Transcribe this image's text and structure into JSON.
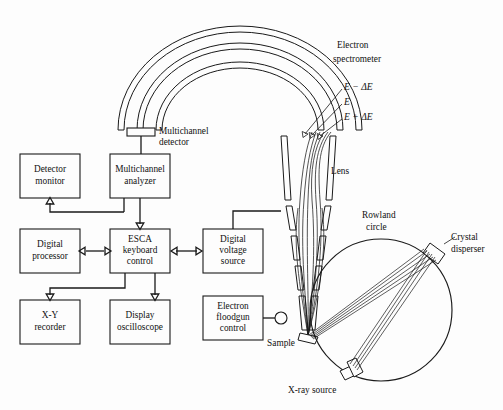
{
  "figure": {
    "background_color": "#fdfdfd",
    "line_color": "#1a1a1a"
  },
  "blocks": [
    {
      "id": "detector-monitor",
      "line1": "Detector",
      "line2": "monitor",
      "line3": ""
    },
    {
      "id": "multichannel-analyzer",
      "line1": "Multichannel",
      "line2": "analyzer",
      "line3": ""
    },
    {
      "id": "digital-processor",
      "line1": "Digital",
      "line2": "processor",
      "line3": ""
    },
    {
      "id": "esca-keyboard-control",
      "line1": "ESCA",
      "line2": "keyboard",
      "line3": "control"
    },
    {
      "id": "digital-voltage-source",
      "line1": "Digital",
      "line2": "voltage",
      "line3": "source"
    },
    {
      "id": "xy-recorder",
      "line1": "X-Y",
      "line2": "recorder",
      "line3": ""
    },
    {
      "id": "display-oscilloscope",
      "line1": "Display",
      "line2": "oscilloscope",
      "line3": ""
    },
    {
      "id": "electron-floodgun-control",
      "line1": "Electron",
      "line2": "floodgun",
      "line3": "control"
    }
  ],
  "callouts": {
    "multichannel_detector_l1": "Multichannel",
    "multichannel_detector_l2": "detector",
    "electron_spectrometer_l1": "Electron",
    "electron_spectrometer_l2": "spectrometer",
    "energy_minus": "E − ΔE",
    "energy_center": "E",
    "energy_plus": "E + ΔE",
    "lens": "Lens",
    "rowland_l1": "Rowland",
    "rowland_l2": "circle",
    "crystal_l1": "Crystal",
    "crystal_l2": "disperser",
    "sample": "Sample",
    "xray_source": "X-ray source"
  }
}
